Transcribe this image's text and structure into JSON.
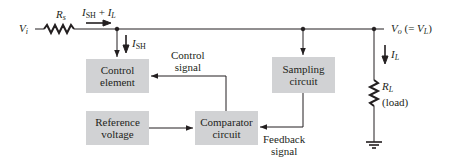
{
  "diagram": {
    "input": {
      "symbol": "V",
      "subscript": "i"
    },
    "series_resistor": {
      "symbol": "R",
      "subscript": "s"
    },
    "total_current": {
      "part1_symbol": "I",
      "part1_sub": "SH",
      "plus": " + ",
      "part2_symbol": "I",
      "part2_sub": "L"
    },
    "shunt_current": {
      "symbol": "I",
      "subscript": "SH"
    },
    "output": {
      "symbol": "V",
      "subscript": "o",
      "equals": " (= ",
      "v_symbol": "V",
      "v_sub": "L",
      "close": ")"
    },
    "load_current": {
      "symbol": "I",
      "subscript": "L"
    },
    "load_resistor": {
      "symbol": "R",
      "subscript": "L",
      "note": "(load)"
    },
    "blocks": {
      "control_element": {
        "line1": "Control",
        "line2": "element"
      },
      "sampling_circuit": {
        "line1": "Sampling",
        "line2": "circuit"
      },
      "reference_voltage": {
        "line1": "Reference",
        "line2": "voltage"
      },
      "comparator_circuit": {
        "line1": "Comparator",
        "line2": "circuit"
      }
    },
    "signals": {
      "control_signal": {
        "line1": "Control",
        "line2": "signal"
      },
      "feedback_signal": {
        "line1": "Feedback",
        "line2": "signal"
      }
    },
    "colors": {
      "block_fill": "#d1d2d4",
      "line": "#231f20"
    }
  }
}
